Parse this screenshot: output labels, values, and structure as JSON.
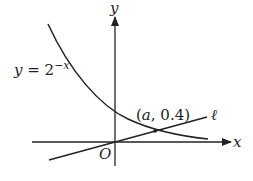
{
  "diagram": {
    "type": "function-graph",
    "colors": {
      "ink": "#222222",
      "background": "#ffffff"
    },
    "axes": {
      "x_label": "x",
      "y_label": "y",
      "origin_label": "O"
    },
    "curve": {
      "label_prefix": "y = 2",
      "label_exponent": "−x",
      "equation": "y = 2^(-x)"
    },
    "line": {
      "label": "ℓ",
      "passes_through_origin": true
    },
    "intersection_point": {
      "label": "(a, 0.4)",
      "x": "a",
      "y": 0.4
    }
  }
}
